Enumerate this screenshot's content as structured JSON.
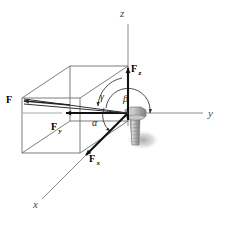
{
  "figure": {
    "background_color": "#ffffff",
    "axes": [
      {
        "name": "z-axis",
        "label": "z",
        "direction": "up",
        "label_x": 122,
        "label_y": 14
      },
      {
        "name": "y-axis",
        "label": "y",
        "direction": "right",
        "label_x": 208,
        "label_y": 116
      },
      {
        "name": "x-axis",
        "label": "x",
        "direction": "lower-left",
        "label_x": 34,
        "label_y": 206
      }
    ],
    "vectors": [
      {
        "name": "resultant-force",
        "label": "F",
        "subscript": "",
        "label_x": 8,
        "label_y": 101
      },
      {
        "name": "force-z-component",
        "label": "F",
        "subscript": "z",
        "label_x": 132,
        "label_y": 73
      },
      {
        "name": "force-y-component",
        "label": "F",
        "subscript": "y",
        "label_x": 53,
        "label_y": 128
      },
      {
        "name": "force-x-component",
        "label": "F",
        "subscript": "x",
        "label_x": 91,
        "label_y": 160
      }
    ],
    "angles": [
      {
        "name": "angle-alpha",
        "label": "α",
        "between": "F and x-axis",
        "label_x": 92,
        "label_y": 126
      },
      {
        "name": "angle-beta",
        "label": "β",
        "between": "F and y-axis",
        "label_x": 124,
        "label_y": 102
      },
      {
        "name": "angle-gamma",
        "label": "γ",
        "between": "F and z-axis",
        "label_x": 101,
        "label_y": 100
      }
    ],
    "objects": [
      {
        "name": "bolt",
        "description": "hex-head bolt at origin with threaded shank and drop shadow"
      },
      {
        "name": "reference-box",
        "description": "wireframe rectangular parallelepiped showing components"
      }
    ],
    "colors": {
      "axis_line": "#8c8c8c",
      "box_line": "#6e6e6e",
      "vector_dark": "#111111",
      "vector_thin": "#555555",
      "bolt_body": "#b4b4b4",
      "bolt_shadow": "#bfbfbf",
      "arc_line": "#222222"
    }
  }
}
